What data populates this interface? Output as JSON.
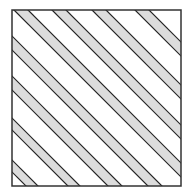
{
  "diagram": {
    "square": {
      "x": 12,
      "y": 10,
      "width": 169,
      "height": 176,
      "stroke": "#333333",
      "fill": "#ffffff"
    },
    "stripe_fill": "#dcdcdc",
    "stripe_stroke": "#222222",
    "stripe_angle_deg": 45,
    "stripes_c": [
      [
        -160,
        -148
      ],
      [
        -118,
        -106
      ],
      [
        -78,
        -64
      ],
      [
        -38,
        -24
      ],
      [
        4,
        18
      ],
      [
        42,
        56
      ],
      [
        82,
        96
      ],
      [
        125,
        139
      ]
    ]
  }
}
